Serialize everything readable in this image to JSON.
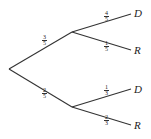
{
  "tree": {
    "branches": [
      {
        "id": "upper",
        "prob": {
          "num": "3",
          "den": "5"
        },
        "children": [
          {
            "label": "D",
            "prob": {
              "num": "4",
              "den": "5"
            }
          },
          {
            "label": "R",
            "prob": {
              "num": "1",
              "den": "5"
            }
          }
        ]
      },
      {
        "id": "lower",
        "prob": {
          "num": "2",
          "den": "5"
        },
        "children": [
          {
            "label": "D",
            "prob": {
              "num": "1",
              "den": "3"
            }
          },
          {
            "label": "R",
            "prob": {
              "num": "2",
              "den": "3"
            }
          }
        ]
      }
    ]
  },
  "colors": {
    "line": "#333333",
    "text": "#222222"
  }
}
